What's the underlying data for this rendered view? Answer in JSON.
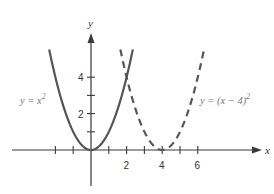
{
  "chart_data": {
    "type": "line",
    "title": "",
    "xlabel": "x",
    "ylabel": "y",
    "xlim": [
      -4.4,
      9.6
    ],
    "ylim": [
      -2,
      6.5
    ],
    "grid": false,
    "x_ticks": [
      -2,
      -1,
      1,
      2,
      3,
      4,
      5,
      6
    ],
    "x_tick_labels": [
      {
        "value": 2,
        "label": "2"
      },
      {
        "value": 4,
        "label": "4"
      },
      {
        "value": 6,
        "label": "6"
      }
    ],
    "y_ticks": [
      1,
      2,
      3,
      4
    ],
    "y_tick_labels": [
      {
        "value": 2,
        "label": "2"
      },
      {
        "value": 4,
        "label": "4"
      }
    ],
    "series": [
      {
        "name": "y = x^2",
        "label": "y = x²",
        "style": "solid",
        "color": "#555555",
        "x_range": [
          -2.35,
          2.35
        ],
        "formula": "x^2",
        "vertex": [
          0,
          0
        ]
      },
      {
        "name": "y = (x - 4)^2",
        "label": "y = (x − 4)²",
        "style": "dashed",
        "color": "#555555",
        "x_range": [
          1.65,
          6.35
        ],
        "formula": "(x-4)^2",
        "vertex": [
          4,
          0
        ]
      }
    ],
    "annotations": [
      {
        "text": "y = x²",
        "near": "left branch of solid parabola"
      },
      {
        "text": "y = (x − 4)²",
        "near": "right branch of dashed parabola"
      }
    ]
  },
  "labels": {
    "x_axis": "x",
    "y_axis": "y",
    "eq1_prefix": "y = x",
    "eq1_exp": "2",
    "eq2_prefix": "y = (x − 4)",
    "eq2_exp": "2",
    "xt2": "2",
    "xt4": "4",
    "xt6": "6",
    "yt2": "2",
    "yt4": "4"
  }
}
